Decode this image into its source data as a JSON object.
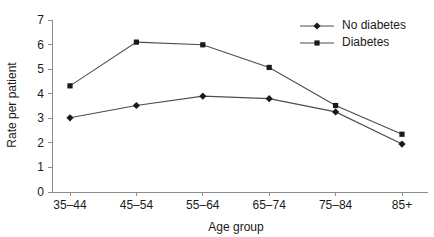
{
  "chart_data": {
    "type": "line",
    "title": "",
    "xlabel": "Age group",
    "ylabel": "Rate per patient",
    "categories": [
      "35–44",
      "45–54",
      "55–64",
      "65–74",
      "75–84",
      "85+"
    ],
    "ylim": [
      0,
      7
    ],
    "ytick_labels": [
      "0",
      "1",
      "2",
      "3",
      "4",
      "5",
      "6",
      "7"
    ],
    "ytick_values": [
      0,
      1,
      2,
      3,
      4,
      5,
      6,
      7
    ],
    "grid": false,
    "legend_position": "top-right",
    "series": [
      {
        "name": "No diabetes",
        "marker": "diamond",
        "color": "#1a1a1a",
        "values": [
          3.02,
          3.52,
          3.9,
          3.8,
          3.26,
          1.95
        ]
      },
      {
        "name": "Diabetes",
        "marker": "square",
        "color": "#1a1a1a",
        "values": [
          4.32,
          6.1,
          5.99,
          5.07,
          3.52,
          2.35
        ]
      }
    ]
  },
  "figure": {
    "axis_color": "#8c8c8c",
    "line_color": "#4d4d4d",
    "marker_color": "#1a1a1a",
    "text_color": "#1a1a1a",
    "background": "#ffffff"
  }
}
